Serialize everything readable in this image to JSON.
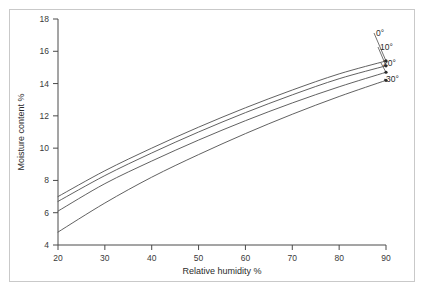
{
  "chart_data": {
    "type": "line",
    "title": "",
    "xlabel": "Relative humidity %",
    "ylabel": "Moisture content %",
    "xlim": [
      20,
      90
    ],
    "ylim": [
      4,
      18
    ],
    "xticks": [
      20,
      30,
      40,
      50,
      60,
      70,
      80,
      90
    ],
    "yticks": [
      4,
      6,
      8,
      10,
      12,
      14,
      16,
      18
    ],
    "grid": false,
    "legend_position": "right-inline-labels",
    "x": [
      20,
      30,
      40,
      50,
      60,
      70,
      80,
      90
    ],
    "series": [
      {
        "name": "0°",
        "label": "0°",
        "values": [
          7.0,
          8.6,
          10.0,
          11.3,
          12.5,
          13.6,
          14.6,
          15.4
        ]
      },
      {
        "name": "10°",
        "label": "10°",
        "values": [
          6.7,
          8.3,
          9.7,
          11.0,
          12.2,
          13.3,
          14.3,
          15.1
        ]
      },
      {
        "name": "20°",
        "label": "20°",
        "values": [
          6.1,
          7.8,
          9.2,
          10.5,
          11.7,
          12.8,
          13.8,
          14.7
        ]
      },
      {
        "name": "30°",
        "label": "30°",
        "values": [
          4.8,
          6.6,
          8.2,
          9.6,
          10.9,
          12.1,
          13.2,
          14.2
        ]
      }
    ],
    "colors": {
      "line": "#4f4f4f",
      "axis": "#4a4a4a",
      "text": "#2b2b2b",
      "frame": "#c9c9c9",
      "background": "#ffffff"
    }
  }
}
